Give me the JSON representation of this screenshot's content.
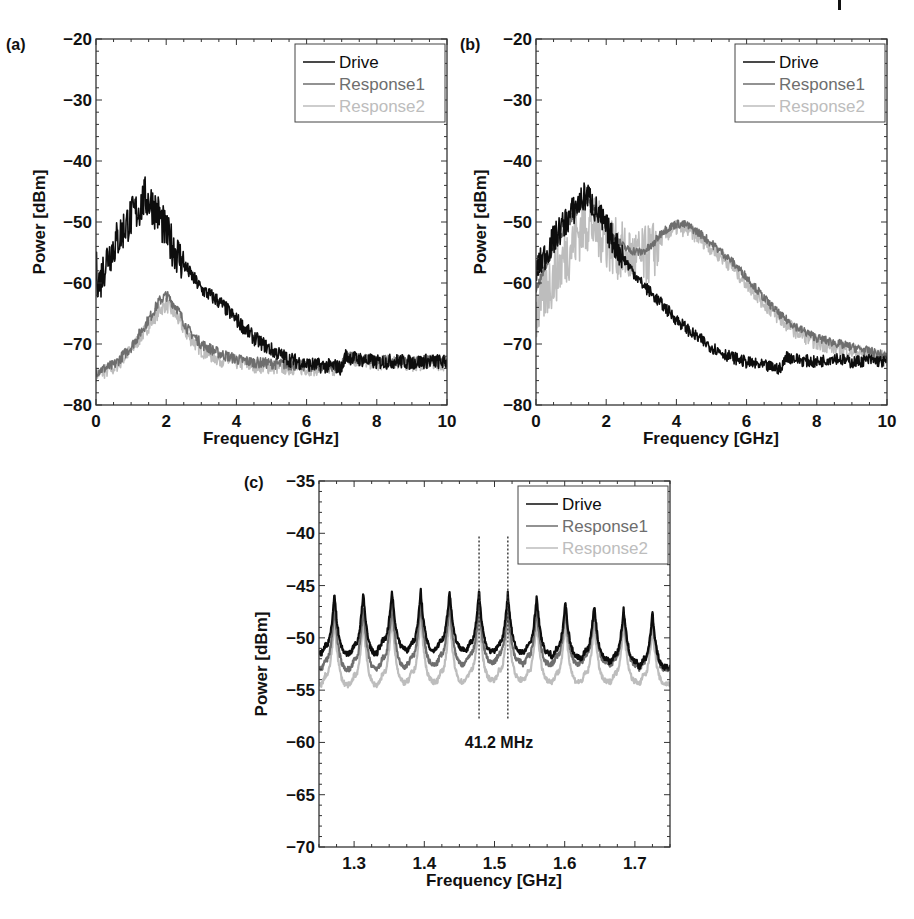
{
  "figure": {
    "header_marker": "|",
    "panels": [
      {
        "id": "a",
        "label": "(a)"
      },
      {
        "id": "b",
        "label": "(b)"
      },
      {
        "id": "c",
        "label": "(c)"
      }
    ]
  },
  "colors": {
    "drive": "#0d0d0d",
    "response1": "#6e6e6e",
    "response2": "#bdbdbd",
    "axis": "#333333",
    "legend_border": "#444444"
  },
  "chart_data": [
    {
      "id": "a",
      "panel_label": "(a)",
      "type": "line",
      "title": "",
      "xlabel": "Frequency [GHz]",
      "ylabel": "Power [dBm]",
      "xlim": [
        0,
        10
      ],
      "ylim": [
        -80,
        -20
      ],
      "xticks": [
        0,
        2,
        4,
        6,
        8,
        10
      ],
      "xtick_labels": [
        "0",
        "2",
        "4",
        "6",
        "8",
        "10"
      ],
      "yticks": [
        -80,
        -70,
        -60,
        -50,
        -40,
        -30,
        -20
      ],
      "ytick_labels": [
        "−80",
        "−70",
        "−60",
        "−50",
        "−40",
        "−30",
        "−20"
      ],
      "grid": false,
      "legend_position": "upper right",
      "legend": [
        "Drive",
        "Response1",
        "Response2"
      ],
      "series": [
        {
          "name": "Drive",
          "color": "#0d0d0d",
          "band": 3.5,
          "x": [
            0,
            0.1,
            0.3,
            0.6,
            0.9,
            1.2,
            1.4,
            1.6,
            1.8,
            2.0,
            2.5,
            3.0,
            3.5,
            4.0,
            4.5,
            5.0,
            5.5,
            6.0,
            6.5,
            6.8,
            7.0,
            7.1,
            7.5,
            8.0,
            8.5,
            9.0,
            9.5,
            10
          ],
          "y": [
            -58,
            -60,
            -56,
            -53,
            -50,
            -48,
            -46,
            -47,
            -49,
            -52,
            -57,
            -61,
            -63,
            -66,
            -69,
            -71,
            -72.5,
            -73.3,
            -73.6,
            -73.6,
            -74,
            -72,
            -72.5,
            -73,
            -72.8,
            -73,
            -72.8,
            -73
          ]
        },
        {
          "name": "Response1",
          "color": "#6e6e6e",
          "band": 1.5,
          "x": [
            0,
            0.5,
            1.0,
            1.5,
            1.8,
            2.0,
            2.3,
            2.6,
            3.0,
            3.5,
            4.0,
            4.5,
            5.0,
            6.0,
            7.0,
            7.1,
            7.5,
            8.0,
            8.5,
            9.0,
            9.5,
            10
          ],
          "y": [
            -74.5,
            -73.5,
            -70.5,
            -66,
            -63,
            -62,
            -64,
            -67.5,
            -70,
            -71.5,
            -72.5,
            -73,
            -73.2,
            -73.6,
            -73.8,
            -72,
            -72.3,
            -72.8,
            -72.6,
            -72.9,
            -72.7,
            -73
          ]
        },
        {
          "name": "Response2",
          "color": "#bdbdbd",
          "band": 2.0,
          "x": [
            0,
            0.5,
            1.0,
            1.5,
            1.8,
            2.0,
            2.3,
            2.6,
            3.0,
            3.5,
            4.0,
            4.5,
            5.0,
            6.0,
            7.0,
            7.1,
            7.5,
            8.0,
            8.5,
            9.0,
            9.5,
            10
          ],
          "y": [
            -75,
            -74,
            -71,
            -67,
            -64.5,
            -63.5,
            -65.5,
            -68.5,
            -71,
            -72.5,
            -73,
            -73.5,
            -73.8,
            -74,
            -74,
            -72.4,
            -72.6,
            -73.2,
            -72.9,
            -73.3,
            -73,
            -73.3
          ]
        }
      ]
    },
    {
      "id": "b",
      "panel_label": "(b)",
      "type": "line",
      "title": "",
      "xlabel": "Frequency [GHz]",
      "ylabel": "Power [dBm]",
      "xlim": [
        0,
        10
      ],
      "ylim": [
        -80,
        -20
      ],
      "xticks": [
        0,
        2,
        4,
        6,
        8,
        10
      ],
      "xtick_labels": [
        "0",
        "2",
        "4",
        "6",
        "8",
        "10"
      ],
      "yticks": [
        -80,
        -70,
        -60,
        -50,
        -40,
        -30,
        -20
      ],
      "ytick_labels": [
        "−80",
        "−70",
        "−60",
        "−50",
        "−40",
        "−30",
        "−20"
      ],
      "grid": false,
      "legend_position": "upper right",
      "legend": [
        "Drive",
        "Response1",
        "Response2"
      ],
      "series": [
        {
          "name": "Drive",
          "color": "#0d0d0d",
          "band": 2.5,
          "x": [
            0,
            0.3,
            0.6,
            0.9,
            1.2,
            1.45,
            1.7,
            2.0,
            2.5,
            3.0,
            3.5,
            4.0,
            4.5,
            5.0,
            5.5,
            6.0,
            6.5,
            6.9,
            7.0,
            7.1,
            7.5,
            8.0,
            8.5,
            9.0,
            9.5,
            10
          ],
          "y": [
            -58,
            -55,
            -52,
            -49.5,
            -47,
            -45.5,
            -48,
            -51,
            -56,
            -60,
            -63,
            -66,
            -68.5,
            -70.5,
            -72,
            -73,
            -73.6,
            -74,
            -74.2,
            -72,
            -72.6,
            -73,
            -72.2,
            -73,
            -72.6,
            -73
          ]
        },
        {
          "name": "Response1",
          "color": "#6e6e6e",
          "band": 1.2,
          "x": [
            0,
            0.3,
            0.6,
            1.0,
            1.3,
            1.5,
            1.8,
            2.2,
            2.6,
            3.0,
            3.3,
            3.6,
            4.0,
            4.3,
            4.7,
            5.0,
            5.5,
            6.0,
            6.5,
            7.0,
            7.5,
            8.0,
            8.5,
            9.0,
            9.5,
            10
          ],
          "y": [
            -61,
            -57,
            -53,
            -49.5,
            -47,
            -46.5,
            -49,
            -52.5,
            -54.5,
            -55,
            -54,
            -51.5,
            -50.3,
            -50.5,
            -52,
            -53.5,
            -56,
            -59,
            -62.5,
            -65.5,
            -67.5,
            -69,
            -69.8,
            -70.5,
            -71.2,
            -72
          ]
        },
        {
          "name": "Response2",
          "color": "#bdbdbd",
          "band": 5.0,
          "x": [
            0,
            0.3,
            0.6,
            1.0,
            1.3,
            1.5,
            1.8,
            2.2,
            2.6,
            3.0,
            3.3,
            3.6,
            4.0,
            4.3,
            4.7,
            5.0,
            5.5,
            6.0,
            6.5,
            7.0,
            7.5,
            8.0,
            8.5,
            9.0,
            9.5,
            10
          ],
          "y": [
            -65,
            -61,
            -58,
            -54,
            -51,
            -50,
            -51.5,
            -54,
            -55.5,
            -56,
            -55,
            -52.5,
            -51,
            -51.2,
            -52.8,
            -54.3,
            -56.8,
            -60,
            -63.3,
            -66.2,
            -68.2,
            -69.8,
            -70.5,
            -71.2,
            -71.8,
            -72.5
          ]
        }
      ]
    },
    {
      "id": "c",
      "panel_label": "(c)",
      "type": "line",
      "title": "",
      "xlabel": "Frequency [GHz]",
      "ylabel": "Power [dBm]",
      "xlim": [
        1.25,
        1.75
      ],
      "ylim": [
        -70,
        -35
      ],
      "xticks": [
        1.3,
        1.4,
        1.5,
        1.6,
        1.7
      ],
      "xtick_labels": [
        "1.3",
        "1.4",
        "1.5",
        "1.6",
        "1.7"
      ],
      "yticks": [
        -70,
        -65,
        -60,
        -55,
        -50,
        -45,
        -40,
        -35
      ],
      "ytick_labels": [
        "−70",
        "−65",
        "−60",
        "−55",
        "−50",
        "−45",
        "−40",
        "−35"
      ],
      "grid": false,
      "legend_position": "upper right",
      "legend": [
        "Drive",
        "Response1",
        "Response2"
      ],
      "comb_spacing_ghz": 0.0412,
      "first_peak_ghz": 1.272,
      "series": [
        {
          "name": "Drive",
          "color": "#0d0d0d",
          "peak_x": [
            1.272,
            1.313,
            1.354,
            1.395,
            1.436,
            1.478,
            1.519,
            1.56,
            1.601,
            1.642,
            1.684,
            1.725
          ],
          "peak_y": [
            -45.8,
            -45.7,
            -45.4,
            -45.5,
            -45.4,
            -45.5,
            -45.7,
            -46.0,
            -46.5,
            -46.8,
            -47.2,
            -47.5
          ],
          "trough_y": [
            -51.5,
            -51.5,
            -51.0,
            -51.2,
            -51.0,
            -51.3,
            -51.3,
            -51.5,
            -51.8,
            -52.0,
            -52.3,
            -52.8
          ]
        },
        {
          "name": "Response1",
          "color": "#6e6e6e",
          "peak_x": [
            1.272,
            1.313,
            1.354,
            1.395,
            1.436,
            1.478,
            1.519,
            1.56,
            1.601,
            1.642,
            1.684,
            1.725
          ],
          "peak_y": [
            -47.0,
            -47.0,
            -46.5,
            -46.5,
            -46.5,
            -46.8,
            -47.0,
            -47.2,
            -47.3,
            -47.4,
            -47.7,
            -48.0
          ],
          "trough_y": [
            -53.0,
            -53.0,
            -52.8,
            -52.6,
            -52.5,
            -52.3,
            -52.3,
            -52.5,
            -52.5,
            -52.4,
            -52.6,
            -53.0
          ]
        },
        {
          "name": "Response2",
          "color": "#bdbdbd",
          "peak_x": [
            1.272,
            1.313,
            1.354,
            1.395,
            1.436,
            1.478,
            1.519,
            1.56,
            1.601,
            1.642,
            1.684,
            1.725
          ],
          "peak_y": [
            -48.2,
            -48.2,
            -47.8,
            -47.8,
            -47.8,
            -48.0,
            -48.1,
            -48.3,
            -48.4,
            -48.5,
            -48.6,
            -48.8
          ],
          "trough_y": [
            -54.5,
            -54.5,
            -54.3,
            -54.2,
            -54.2,
            -54.0,
            -54.0,
            -54.1,
            -54.2,
            -54.2,
            -54.2,
            -54.4
          ]
        }
      ],
      "annotations": [
        {
          "type": "vline",
          "x": 1.478,
          "y_from": -40.3,
          "y_to": -57.8,
          "style": "dotted"
        },
        {
          "type": "vline",
          "x": 1.519,
          "y_from": -40.3,
          "y_to": -57.8,
          "style": "dotted"
        },
        {
          "type": "text",
          "text": "41.2 MHz",
          "x": 1.499,
          "y": -60.0
        }
      ]
    }
  ]
}
